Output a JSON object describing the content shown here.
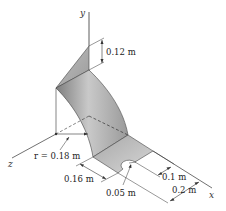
{
  "figure": {
    "type": "3D engineering sketch"
  },
  "axes": {
    "x_label": "x",
    "y_label": "y",
    "z_label": "z"
  },
  "dimensions": {
    "triangle_height": "0.12 m",
    "radius": "r = 0.18 m",
    "plate_length": "0.16 m",
    "hole_radius": "0.05 m",
    "hole_offset": "0.1 m",
    "plate_width": "0.2 m"
  },
  "colors": {
    "surface_light": "#d4d4d4",
    "surface_mid": "#b0b0b0",
    "surface_dark": "#8a8a8a",
    "line": "#333333"
  }
}
